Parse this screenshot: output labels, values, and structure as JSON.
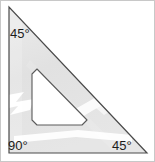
{
  "figure": {
    "name": "set-square-drafting-triangle",
    "labels": {
      "top_angle": "45°",
      "bottom_left_angle": "90°",
      "bottom_right_angle": "45°"
    },
    "colors": {
      "body_fill": "#e3e3e3",
      "body_stroke": "#4a4a4a",
      "cutout_fill": "#ffffff",
      "cutout_stroke": "#5a5a5a",
      "highlight": "#ffffff",
      "frame_border": "#c8c8c8",
      "label_text": "#1c1c1c",
      "background": "#ffffff"
    },
    "geometry": {
      "outer_triangle_points": "9,7 9,153 147,153",
      "cutout_triangle_points": "32,69 32,125 87,125",
      "cutout_corner_radius": 5
    }
  }
}
